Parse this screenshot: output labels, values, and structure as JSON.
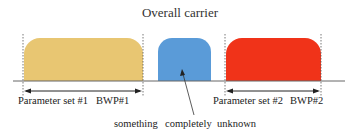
{
  "title": "Overall carrier",
  "blocks": [
    {
      "name": "bwp1",
      "color": "#e8c672"
    },
    {
      "name": "unknown",
      "color": "#5a9bd8"
    },
    {
      "name": "bwp2",
      "color": "#f03319"
    }
  ],
  "labels": {
    "param_set_1": "Parameter set #1",
    "bwp_1": "BWP#1",
    "param_set_2": "Parameter set #2",
    "bwp_2": "BWP#2",
    "bottom": {
      "w1": "something",
      "w2": "completely",
      "w3": "unknown"
    }
  }
}
